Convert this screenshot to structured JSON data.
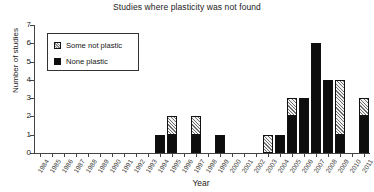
{
  "chart_data": {
    "type": "bar",
    "title": "Studies where plasticity was not found",
    "xlabel": "Year",
    "ylabel": "Number of studies",
    "stacked": true,
    "grid": false,
    "legend_position": "upper-left-inside",
    "ylim": [
      0,
      7
    ],
    "yticks": [
      0,
      1,
      2,
      3,
      4,
      5,
      6,
      7
    ],
    "categories": [
      "1984",
      "1985",
      "1986",
      "1987",
      "1988",
      "1989",
      "1990",
      "1991",
      "1992",
      "1993",
      "1994",
      "1995",
      "1996",
      "1997",
      "1998",
      "1999",
      "2000",
      "2001",
      "2002",
      "2003",
      "2004",
      "2005",
      "2006",
      "2007",
      "2008",
      "2009",
      "2010",
      "2011"
    ],
    "series": [
      {
        "name": "None plastic",
        "style": "solid-black",
        "color": "#0d0d0d",
        "values": [
          0,
          0,
          0,
          0,
          0,
          0,
          0,
          0,
          0,
          0,
          1,
          1,
          0,
          1,
          0,
          1,
          0,
          0,
          0,
          0,
          1,
          2,
          3,
          6,
          4,
          1,
          0,
          2
        ]
      },
      {
        "name": "Some not plastic",
        "style": "hatched",
        "color": "#f2f2f2",
        "values": [
          0,
          0,
          0,
          0,
          0,
          0,
          0,
          0,
          0,
          0,
          0,
          1,
          0,
          1,
          0,
          0,
          0,
          0,
          0,
          1,
          0,
          1,
          0,
          0,
          0,
          3,
          0,
          1
        ]
      }
    ],
    "totals": [
      0,
      0,
      0,
      0,
      0,
      0,
      0,
      0,
      0,
      0,
      1,
      2,
      0,
      2,
      0,
      1,
      0,
      0,
      0,
      1,
      1,
      3,
      3,
      6,
      4,
      4,
      0,
      3
    ]
  },
  "legend": {
    "entries": [
      {
        "label": "Some not plastic",
        "style": "hatch"
      },
      {
        "label": "None plastic",
        "style": "black"
      }
    ]
  }
}
